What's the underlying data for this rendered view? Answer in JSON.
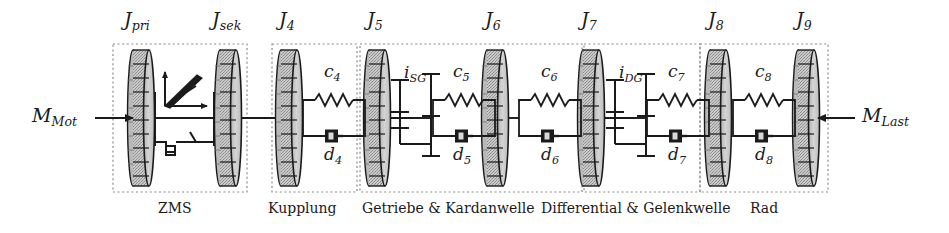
{
  "figure": {
    "kind": "drivetrain-torsional-vibration-model",
    "canvas": {
      "width": 949,
      "height": 233
    },
    "background_color": "#ffffff",
    "line_color": "#1a1a1a",
    "disc_fill_color": "#c9c9c9",
    "group_border_color": "#8a8a8a"
  },
  "torques": {
    "input": {
      "base": "M",
      "sub": "Mot",
      "x": 52,
      "y": 104,
      "arrow_direction": "right"
    },
    "output": {
      "base": "M",
      "sub": "Last",
      "x": 862,
      "y": 104,
      "arrow_direction": "left"
    }
  },
  "inertias": [
    {
      "id": "J_pri",
      "base": "J",
      "sub": "pri",
      "cx": 141,
      "label_x": 124,
      "label_y": 8
    },
    {
      "id": "J_sek",
      "base": "J",
      "sub": "sek",
      "cx": 228,
      "label_x": 212,
      "label_y": 8
    },
    {
      "id": "J_4",
      "base": "J",
      "sub": "4",
      "cx": 289,
      "label_x": 277,
      "label_y": 8
    },
    {
      "id": "J_5",
      "base": "J",
      "sub": "5",
      "cx": 377,
      "label_x": 365,
      "label_y": 8
    },
    {
      "id": "J_6",
      "base": "J",
      "sub": "6",
      "cx": 495,
      "label_x": 483,
      "label_y": 8
    },
    {
      "id": "J_7",
      "base": "J",
      "sub": "7",
      "cx": 591,
      "label_x": 579,
      "label_y": 8
    },
    {
      "id": "J_8",
      "base": "J",
      "sub": "8",
      "cx": 718,
      "label_x": 706,
      "label_y": 8
    },
    {
      "id": "J_9",
      "base": "J",
      "sub": "9",
      "cx": 806,
      "label_x": 794,
      "label_y": 8
    }
  ],
  "stiffness": [
    {
      "id": "c_4",
      "base": "c",
      "sub": "4",
      "x": 324,
      "y": 61
    },
    {
      "id": "c_5",
      "base": "c",
      "sub": "5",
      "x": 451,
      "y": 61
    },
    {
      "id": "c_6",
      "base": "c",
      "sub": "6",
      "x": 541,
      "y": 61
    },
    {
      "id": "c_7",
      "base": "c",
      "sub": "7",
      "x": 667,
      "y": 61
    },
    {
      "id": "c_8",
      "base": "c",
      "sub": "8",
      "x": 755,
      "y": 61
    }
  ],
  "damping": [
    {
      "id": "d_4",
      "base": "d",
      "sub": "4",
      "x": 324,
      "y": 144
    },
    {
      "id": "d_5",
      "base": "d",
      "sub": "5",
      "x": 451,
      "y": 144
    },
    {
      "id": "d_6",
      "base": "d",
      "sub": "6",
      "x": 541,
      "y": 144
    },
    {
      "id": "d_7",
      "base": "d",
      "sub": "7",
      "x": 667,
      "y": 144
    },
    {
      "id": "d_8",
      "base": "d",
      "sub": "8",
      "x": 755,
      "y": 144
    }
  ],
  "gear_ratios": [
    {
      "id": "i_SG",
      "base": "i",
      "sub": "SG",
      "x": 405,
      "y": 62,
      "shaft_x": 421
    },
    {
      "id": "i_DG",
      "base": "i",
      "sub": "DG",
      "x": 619,
      "y": 62,
      "shaft_x": 636
    }
  ],
  "groups": [
    {
      "id": "zms",
      "label": "ZMS",
      "x": 113,
      "y": 44,
      "w": 134,
      "h": 148,
      "label_x": 158,
      "label_y": 200
    },
    {
      "id": "kupplung",
      "label": "Kupplung",
      "x": 272,
      "y": 44,
      "w": 85,
      "h": 148,
      "label_x": 271,
      "label_y": 200
    },
    {
      "id": "getriebe",
      "label": "Getriebe & Kardanwelle",
      "x": 360,
      "y": 44,
      "w": 222,
      "h": 148,
      "label_x": 364,
      "label_y": 200
    },
    {
      "id": "differential",
      "label": "Differential & Gelenkwelle",
      "x": 584,
      "y": 44,
      "w": 116,
      "h": 148,
      "label_x": 545,
      "label_y": 200
    },
    {
      "id": "rad",
      "label": "Rad",
      "x": 700,
      "y": 44,
      "w": 128,
      "h": 148,
      "label_x": 752,
      "label_y": 200
    }
  ],
  "zms_detail": {
    "symbol": "nonlinear-spring-damper-characteristic",
    "x": 160,
    "y": 68
  },
  "shaft_y": 118
}
